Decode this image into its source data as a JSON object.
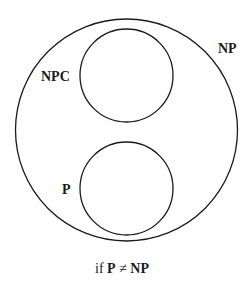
{
  "diagram": {
    "type": "euler-diagram",
    "sets": [
      {
        "id": "np",
        "label": "NP",
        "contains": [
          "npc",
          "p"
        ]
      },
      {
        "id": "npc",
        "label": "NPC"
      },
      {
        "id": "p",
        "label": "P"
      }
    ],
    "labels": {
      "np": "NP",
      "npc": "NPC",
      "p": "P"
    },
    "caption": {
      "prefix": "if",
      "left": "P",
      "relation": "≠",
      "right": "NP"
    },
    "colors": {
      "stroke": "#1a1a1a",
      "background": "#ffffff"
    }
  }
}
